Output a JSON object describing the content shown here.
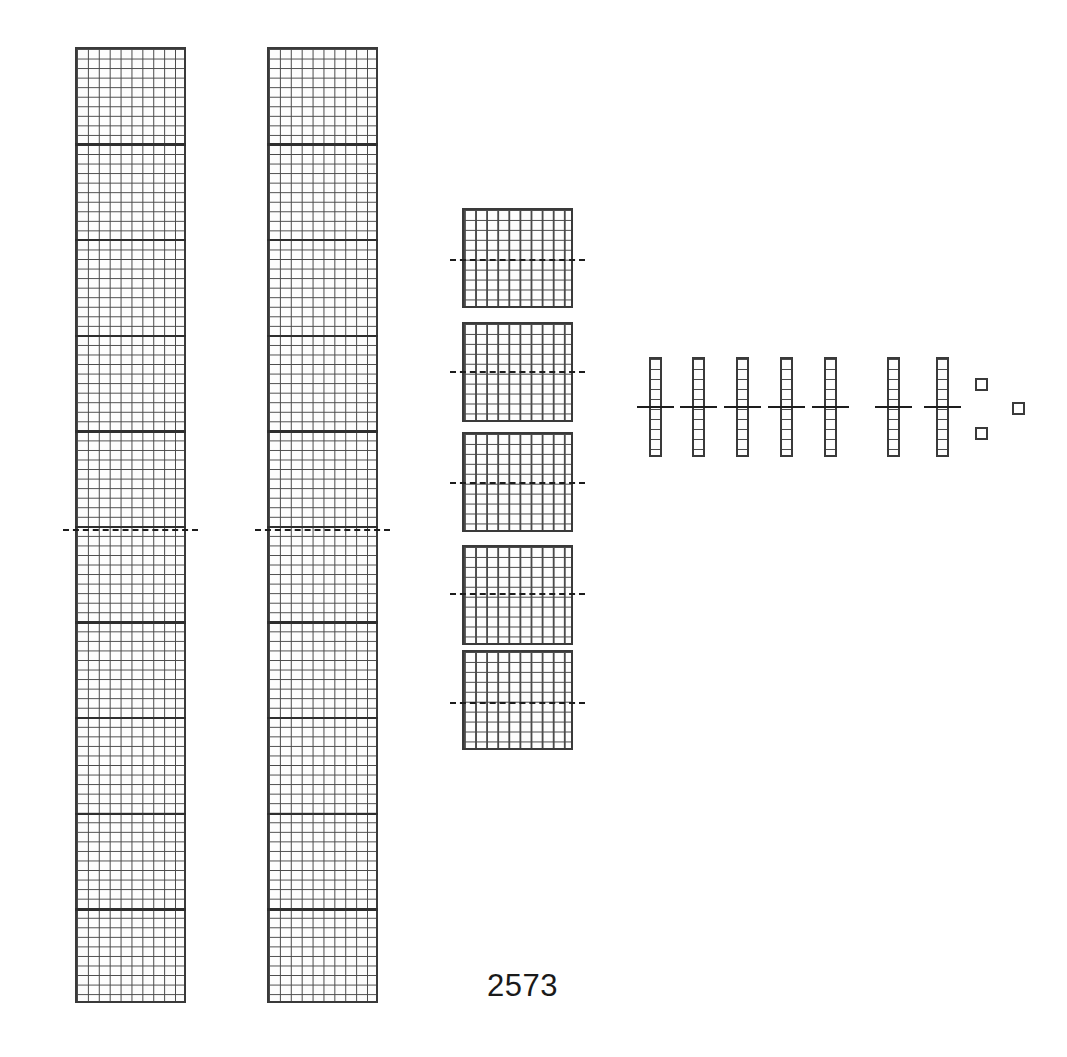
{
  "canvas": {
    "width": 1067,
    "height": 1057,
    "background": "#ffffff"
  },
  "caption": {
    "text": "2573",
    "x": 487,
    "y": 968,
    "font_size": 31,
    "color": "#1a1a1a"
  },
  "style": {
    "outline_color": "#3a3a3a",
    "grid_color": "#4a4a4a",
    "rule_color": "#1d1d1d",
    "decade_color": "#2e2e2e",
    "fill_color": "#fdfdfd"
  },
  "chart_data": {
    "type": "diagram",
    "title": "2573",
    "notation": "base-ten place-value blocks with median rules",
    "place_values": [
      {
        "name": "thousands",
        "block_count": 2,
        "unit_per_block": 1000,
        "subtotal": 2000
      },
      {
        "name": "hundreds",
        "block_count": 5,
        "unit_per_block": 100,
        "subtotal": 500
      },
      {
        "name": "tens",
        "block_count": 7,
        "unit_per_block": 10,
        "subtotal": 70
      },
      {
        "name": "ones",
        "block_count": 3,
        "unit_per_block": 1,
        "subtotal": 3
      }
    ],
    "total": 2573
  },
  "groups": {
    "thousands": {
      "label": "thousand-columns",
      "cols": 10,
      "rows": 100,
      "decade_rows": [
        10,
        20,
        30,
        40,
        50,
        60,
        70,
        80,
        90
      ],
      "blocks": [
        {
          "id": "thousand-1",
          "x": 75,
          "y": 47,
          "w": 111,
          "h": 956
        },
        {
          "id": "thousand-2",
          "x": 267,
          "y": 47,
          "w": 111,
          "h": 956
        }
      ],
      "median_rules": [
        {
          "for": "thousand-1",
          "x": 63,
          "y": 529,
          "w": 135
        },
        {
          "for": "thousand-2",
          "x": 255,
          "y": 529,
          "w": 135
        }
      ]
    },
    "hundreds": {
      "label": "hundred-flats",
      "cols": 10,
      "rows": 10,
      "blocks": [
        {
          "id": "hundred-1",
          "x": 462,
          "y": 208,
          "w": 111,
          "h": 100
        },
        {
          "id": "hundred-2",
          "x": 462,
          "y": 322,
          "w": 111,
          "h": 100
        },
        {
          "id": "hundred-3",
          "x": 462,
          "y": 432,
          "w": 111,
          "h": 100
        },
        {
          "id": "hundred-4",
          "x": 462,
          "y": 545,
          "w": 111,
          "h": 100
        },
        {
          "id": "hundred-5",
          "x": 462,
          "y": 650,
          "w": 111,
          "h": 100
        }
      ],
      "median_rules": [
        {
          "for": "hundred-1",
          "x": 450,
          "y": 259,
          "w": 135
        },
        {
          "for": "hundred-2",
          "x": 450,
          "y": 371,
          "w": 135
        },
        {
          "for": "hundred-3",
          "x": 450,
          "y": 482,
          "w": 135
        },
        {
          "for": "hundred-4",
          "x": 450,
          "y": 593,
          "w": 135
        },
        {
          "for": "hundred-5",
          "x": 450,
          "y": 702,
          "w": 135
        }
      ]
    },
    "tens": {
      "label": "ten-rods",
      "cols": 1,
      "rows": 10,
      "blocks": [
        {
          "id": "ten-1",
          "x": 649,
          "y": 357,
          "w": 13,
          "h": 100
        },
        {
          "id": "ten-2",
          "x": 692,
          "y": 357,
          "w": 13,
          "h": 100
        },
        {
          "id": "ten-3",
          "x": 736,
          "y": 357,
          "w": 13,
          "h": 100
        },
        {
          "id": "ten-4",
          "x": 780,
          "y": 357,
          "w": 13,
          "h": 100
        },
        {
          "id": "ten-5",
          "x": 824,
          "y": 357,
          "w": 13,
          "h": 100
        },
        {
          "id": "ten-6",
          "x": 887,
          "y": 357,
          "w": 13,
          "h": 100
        },
        {
          "id": "ten-7",
          "x": 936,
          "y": 357,
          "w": 13,
          "h": 100
        }
      ],
      "median_rules": [
        {
          "for": "ten-1",
          "x": 637,
          "y": 406,
          "w": 37
        },
        {
          "for": "ten-2",
          "x": 680,
          "y": 406,
          "w": 37
        },
        {
          "for": "ten-3",
          "x": 724,
          "y": 406,
          "w": 37
        },
        {
          "for": "ten-4",
          "x": 768,
          "y": 406,
          "w": 37
        },
        {
          "for": "ten-5",
          "x": 812,
          "y": 406,
          "w": 37
        },
        {
          "for": "ten-6",
          "x": 875,
          "y": 406,
          "w": 37
        },
        {
          "for": "ten-7",
          "x": 924,
          "y": 406,
          "w": 37
        }
      ]
    },
    "ones": {
      "label": "unit-cubes",
      "blocks": [
        {
          "id": "one-1",
          "x": 975,
          "y": 378,
          "w": 13,
          "h": 13
        },
        {
          "id": "one-2",
          "x": 975,
          "y": 427,
          "w": 13,
          "h": 13
        },
        {
          "id": "one-3",
          "x": 1012,
          "y": 402,
          "w": 13,
          "h": 13
        }
      ]
    }
  }
}
